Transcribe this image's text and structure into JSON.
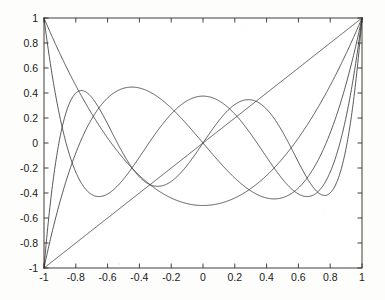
{
  "chart_data": {
    "type": "line",
    "title": "",
    "subtitle": "",
    "xlabel": "",
    "ylabel": "",
    "xlim": [
      -1,
      1
    ],
    "ylim": [
      -1,
      1
    ],
    "grid": false,
    "legend": "none",
    "background": "#fdfdfc",
    "line_color": "#3a3a3a",
    "axis_color": "#2b2b2b",
    "x_ticks": [
      -1,
      -0.8,
      -0.6,
      -0.4,
      -0.2,
      0,
      0.2,
      0.4,
      0.6,
      0.8,
      1
    ],
    "x_tick_labels": [
      "-1",
      "-0.8",
      "-0.6",
      "-0.4",
      "-0.2",
      "0",
      "0.2",
      "0.4",
      "0.6",
      "0.8",
      "1"
    ],
    "y_ticks": [
      -1,
      -0.8,
      -0.6,
      -0.4,
      -0.2,
      0,
      0.2,
      0.4,
      0.6,
      0.8,
      1
    ],
    "y_tick_labels": [
      "-1",
      "-0.8",
      "-0.6",
      "-0.4",
      "-0.2",
      "0",
      "0.2",
      "0.4",
      "0.6",
      "0.8",
      "1"
    ],
    "x": [
      -1,
      -0.98,
      -0.96,
      -0.94,
      -0.92,
      -0.9,
      -0.88,
      -0.86,
      -0.84,
      -0.82,
      -0.8,
      -0.78,
      -0.76,
      -0.74,
      -0.72,
      -0.7,
      -0.68,
      -0.66,
      -0.64,
      -0.62,
      -0.6,
      -0.58,
      -0.56,
      -0.54,
      -0.52,
      -0.5,
      -0.48,
      -0.46,
      -0.44,
      -0.42,
      -0.4,
      -0.38,
      -0.36,
      -0.34,
      -0.32,
      -0.3,
      -0.28,
      -0.26,
      -0.24,
      -0.22,
      -0.2,
      -0.18,
      -0.16,
      -0.14,
      -0.12,
      -0.1,
      -0.08,
      -0.06,
      -0.04,
      -0.02,
      0,
      0.02,
      0.04,
      0.06,
      0.08,
      0.1,
      0.12,
      0.14,
      0.16,
      0.18,
      0.2,
      0.22,
      0.24,
      0.26,
      0.28,
      0.3,
      0.32,
      0.34,
      0.36,
      0.38,
      0.4,
      0.42,
      0.44,
      0.46,
      0.48,
      0.5,
      0.52,
      0.54,
      0.56,
      0.58,
      0.6,
      0.62,
      0.64,
      0.66,
      0.68,
      0.7,
      0.72,
      0.74,
      0.76,
      0.78,
      0.8,
      0.82,
      0.84,
      0.86,
      0.88,
      0.9,
      0.92,
      0.94,
      0.96,
      0.98,
      1
    ],
    "series": [
      {
        "name": "P1",
        "degree": 1,
        "endpoint_left": -1,
        "endpoint_right": 1,
        "extrema": [],
        "zeros": [
          0
        ]
      },
      {
        "name": "P2",
        "degree": 2,
        "endpoint_left": 1,
        "endpoint_right": 1,
        "extrema": [
          {
            "x": 0,
            "y": -0.5
          }
        ],
        "zeros": [
          -0.5774,
          0.5774
        ]
      },
      {
        "name": "P3",
        "degree": 3,
        "endpoint_left": -1,
        "endpoint_right": 1,
        "extrema": [
          {
            "x": -0.4472,
            "y": 0.3849
          },
          {
            "x": 0.4472,
            "y": -0.3849
          }
        ],
        "zeros": [
          -0.7746,
          0,
          0.7746
        ]
      },
      {
        "name": "P4",
        "degree": 4,
        "endpoint_left": 1,
        "endpoint_right": 1,
        "extrema": [
          {
            "x": -0.6547,
            "y": -0.4286
          },
          {
            "x": 0,
            "y": 0.375
          },
          {
            "x": 0.6547,
            "y": -0.4286
          }
        ],
        "zeros": [
          -0.861,
          -0.3399,
          0.3399,
          0.861
        ]
      },
      {
        "name": "P5",
        "degree": 5,
        "endpoint_left": -1,
        "endpoint_right": 1,
        "extrema": [
          {
            "x": -0.7651,
            "y": 0.4196
          },
          {
            "x": -0.2852,
            "y": -0.3466
          },
          {
            "x": 0.2852,
            "y": 0.3466
          },
          {
            "x": 0.7651,
            "y": -0.4196
          }
        ],
        "zeros": [
          -0.9062,
          -0.5385,
          0,
          0.5385,
          0.9062
        ]
      }
    ]
  },
  "figure": {
    "plot_left_px": 44,
    "plot_right_px": 362,
    "plot_top_px": 18,
    "plot_bottom_px": 268
  }
}
